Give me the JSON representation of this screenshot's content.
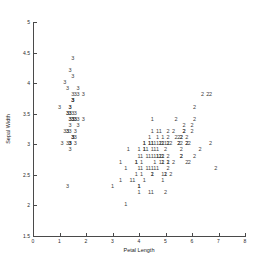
{
  "chart_data": {
    "type": "scatter",
    "title": "",
    "xlabel": "Petal Length",
    "ylabel": "Sepal Width",
    "xlim": [
      0,
      8
    ],
    "ylim": [
      1.5,
      5
    ],
    "xticks": [
      0,
      1,
      2,
      3,
      4,
      5,
      6,
      7,
      8
    ],
    "xticklabels": [
      "0",
      "1",
      "2",
      "3",
      "4",
      "5",
      "6",
      "7",
      "8"
    ],
    "yticks": [
      1.5,
      2,
      2.5,
      3,
      3.5,
      4,
      4.5,
      5
    ],
    "yticklabels": [
      "1.5",
      "2",
      "2.5",
      "3",
      "3.5",
      "4",
      "4.5",
      "5"
    ],
    "grid": false,
    "legend": "none",
    "marker_style": "cluster-index-text",
    "series": [
      {
        "name": "1",
        "label": "1",
        "color": "#3c3c3c",
        "points": [
          [
            4.7,
            3.2
          ],
          [
            4.5,
            3.2
          ],
          [
            4.9,
            3.1
          ],
          [
            4.0,
            2.3
          ],
          [
            4.6,
            2.8
          ],
          [
            4.5,
            2.8
          ],
          [
            4.7,
            2.8
          ],
          [
            3.3,
            2.4
          ],
          [
            4.6,
            2.9
          ],
          [
            3.9,
            2.7
          ],
          [
            3.5,
            2.0
          ],
          [
            4.2,
            3.0
          ],
          [
            4.0,
            2.2
          ],
          [
            4.7,
            2.9
          ],
          [
            3.6,
            2.9
          ],
          [
            4.4,
            3.1
          ],
          [
            4.5,
            3.0
          ],
          [
            4.1,
            2.7
          ],
          [
            4.5,
            2.2
          ],
          [
            3.9,
            2.5
          ],
          [
            4.8,
            3.2
          ],
          [
            4.0,
            2.8
          ],
          [
            4.9,
            2.5
          ],
          [
            4.7,
            2.8
          ],
          [
            4.3,
            2.9
          ],
          [
            4.4,
            3.0
          ],
          [
            4.8,
            2.8
          ],
          [
            5.0,
            3.0
          ],
          [
            4.5,
            2.9
          ],
          [
            3.5,
            2.6
          ],
          [
            3.8,
            2.4
          ],
          [
            3.7,
            2.4
          ],
          [
            3.9,
            2.7
          ],
          [
            5.1,
            2.7
          ],
          [
            4.5,
            3.0
          ],
          [
            4.5,
            3.4
          ],
          [
            4.7,
            3.1
          ],
          [
            4.4,
            3.0
          ],
          [
            4.1,
            2.5
          ],
          [
            4.0,
            2.6
          ],
          [
            4.4,
            2.6
          ],
          [
            4.6,
            3.0
          ],
          [
            4.0,
            2.3
          ],
          [
            3.3,
            2.7
          ],
          [
            4.2,
            3.0
          ],
          [
            4.2,
            2.9
          ],
          [
            4.2,
            2.9
          ],
          [
            4.3,
            2.6
          ],
          [
            3.0,
            2.3
          ],
          [
            4.1,
            2.6
          ],
          [
            4.8,
            2.7
          ],
          [
            5.0,
            2.5
          ],
          [
            4.9,
            2.8
          ],
          [
            4.6,
            2.7
          ],
          [
            4.5,
            2.5
          ],
          [
            4.8,
            3.0
          ],
          [
            4.9,
            3.0
          ],
          [
            4.7,
            3.0
          ],
          [
            4.4,
            2.8
          ],
          [
            4.1,
            2.8
          ],
          [
            5.1,
            3.0
          ],
          [
            4.9,
            2.7
          ],
          [
            4.6,
            2.6
          ],
          [
            4.0,
            2.9
          ],
          [
            4.3,
            2.8
          ],
          [
            4.5,
            2.6
          ],
          [
            4.9,
            2.4
          ],
          [
            4.7,
            2.6
          ],
          [
            4.2,
            2.4
          ],
          [
            4.4,
            2.2
          ]
        ]
      },
      {
        "name": "2",
        "label": "2",
        "color": "#3c3c3c",
        "points": [
          [
            6.0,
            3.3
          ],
          [
            5.1,
            2.7
          ],
          [
            5.9,
            3.0
          ],
          [
            5.6,
            2.9
          ],
          [
            5.8,
            3.0
          ],
          [
            6.6,
            3.8
          ],
          [
            4.5,
            2.5
          ],
          [
            6.3,
            2.9
          ],
          [
            5.8,
            2.7
          ],
          [
            6.1,
            3.6
          ],
          [
            5.1,
            3.2
          ],
          [
            5.3,
            2.7
          ],
          [
            5.5,
            3.0
          ],
          [
            5.0,
            2.5
          ],
          [
            5.1,
            2.8
          ],
          [
            5.3,
            3.2
          ],
          [
            5.5,
            3.0
          ],
          [
            6.7,
            3.8
          ],
          [
            6.9,
            2.6
          ],
          [
            5.0,
            2.2
          ],
          [
            5.7,
            3.2
          ],
          [
            4.9,
            2.8
          ],
          [
            6.7,
            3.0
          ],
          [
            4.9,
            2.7
          ],
          [
            5.7,
            3.3
          ],
          [
            6.0,
            3.2
          ],
          [
            4.8,
            2.8
          ],
          [
            4.9,
            3.0
          ],
          [
            5.6,
            2.8
          ],
          [
            5.8,
            3.0
          ],
          [
            6.1,
            2.8
          ],
          [
            6.4,
            3.8
          ],
          [
            5.6,
            2.8
          ],
          [
            5.1,
            2.6
          ],
          [
            5.6,
            3.0
          ],
          [
            6.1,
            3.4
          ],
          [
            5.6,
            3.1
          ],
          [
            5.5,
            3.1
          ],
          [
            4.8,
            3.0
          ],
          [
            5.4,
            3.1
          ],
          [
            5.6,
            3.1
          ],
          [
            5.1,
            3.1
          ],
          [
            5.9,
            2.7
          ],
          [
            5.7,
            3.2
          ],
          [
            5.2,
            3.0
          ],
          [
            5.0,
            2.9
          ],
          [
            5.2,
            2.5
          ],
          [
            5.4,
            3.4
          ],
          [
            5.1,
            3.0
          ],
          [
            5.8,
            3.1
          ]
        ]
      },
      {
        "name": "3",
        "label": "3",
        "color": "#3c3c3c",
        "points": [
          [
            1.4,
            3.5
          ],
          [
            1.4,
            3.0
          ],
          [
            1.3,
            3.2
          ],
          [
            1.5,
            3.1
          ],
          [
            1.4,
            3.6
          ],
          [
            1.7,
            3.9
          ],
          [
            1.4,
            3.4
          ],
          [
            1.5,
            3.4
          ],
          [
            1.4,
            2.9
          ],
          [
            1.5,
            3.1
          ],
          [
            1.5,
            3.7
          ],
          [
            1.6,
            3.4
          ],
          [
            1.4,
            3.0
          ],
          [
            1.1,
            3.0
          ],
          [
            1.2,
            4.0
          ],
          [
            1.5,
            4.4
          ],
          [
            1.3,
            3.9
          ],
          [
            1.4,
            3.5
          ],
          [
            1.7,
            3.8
          ],
          [
            1.5,
            3.8
          ],
          [
            1.7,
            3.4
          ],
          [
            1.5,
            3.7
          ],
          [
            1.0,
            3.6
          ],
          [
            1.7,
            3.3
          ],
          [
            1.9,
            3.4
          ],
          [
            1.6,
            3.0
          ],
          [
            1.6,
            3.4
          ],
          [
            1.5,
            3.5
          ],
          [
            1.4,
            3.4
          ],
          [
            1.6,
            3.2
          ],
          [
            1.6,
            3.1
          ],
          [
            1.5,
            3.4
          ],
          [
            1.5,
            4.1
          ],
          [
            1.4,
            4.2
          ],
          [
            1.5,
            3.1
          ],
          [
            1.2,
            3.2
          ],
          [
            1.3,
            3.5
          ],
          [
            1.4,
            3.6
          ],
          [
            1.3,
            3.0
          ],
          [
            1.5,
            3.4
          ],
          [
            1.3,
            3.5
          ],
          [
            1.3,
            2.3
          ],
          [
            1.3,
            3.2
          ],
          [
            1.6,
            3.5
          ],
          [
            1.9,
            3.8
          ],
          [
            1.4,
            3.0
          ],
          [
            1.6,
            3.8
          ],
          [
            1.4,
            3.2
          ],
          [
            1.5,
            3.7
          ],
          [
            1.4,
            3.3
          ]
        ]
      }
    ]
  }
}
